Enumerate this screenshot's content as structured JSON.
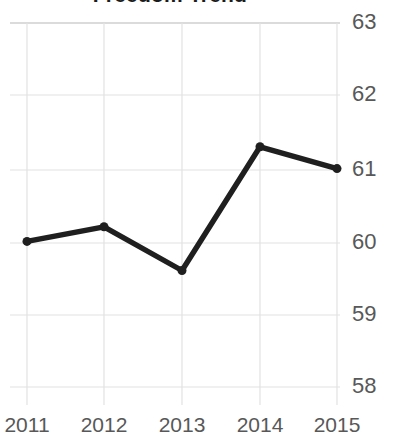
{
  "chart_data": {
    "type": "line",
    "title": "Freedom Trend",
    "xlabel": "",
    "ylabel": "",
    "categories": [
      "2011",
      "2012",
      "2013",
      "2014",
      "2015"
    ],
    "x": [
      2011,
      2012,
      2013,
      2014,
      2015
    ],
    "values": [
      60.0,
      60.2,
      59.6,
      61.3,
      61.0
    ],
    "series": [
      {
        "name": "Freedom Trend",
        "values": [
          60.0,
          60.2,
          59.6,
          61.3,
          61.0
        ]
      }
    ],
    "ylim": [
      58,
      63
    ],
    "yticks": [
      58,
      59,
      60,
      61,
      62,
      63
    ],
    "ytick_labels": [
      "58",
      "59",
      "60",
      "61",
      "62",
      "63"
    ],
    "xticks": [
      2011,
      2012,
      2013,
      2014,
      2015
    ],
    "xtick_labels": [
      "2011",
      "2012",
      "2013",
      "2014",
      "2015"
    ],
    "grid": true,
    "grid_axis": "both",
    "legend": false,
    "legend_position": "none",
    "y_axis_side": "right",
    "markers": true,
    "line_color": "#1f1f1f",
    "marker_color": "#1f1f1f",
    "grid_color": "#d9d9d9",
    "background_color": "#ffffff",
    "tick_label_color": "#585858",
    "title_color": "#1b1b1b",
    "line_width": 5,
    "marker_size": 9,
    "annotations": []
  },
  "axes": {
    "y_labels": [
      {
        "text": "63",
        "value": 63
      },
      {
        "text": "62",
        "value": 62
      },
      {
        "text": "61",
        "value": 61
      },
      {
        "text": "60",
        "value": 60
      },
      {
        "text": "59",
        "value": 59
      },
      {
        "text": "58",
        "value": 58
      }
    ],
    "x_labels": [
      {
        "text": "2011",
        "value": 2011
      },
      {
        "text": "2012",
        "value": 2012
      },
      {
        "text": "2013",
        "value": 2013
      },
      {
        "text": "2014",
        "value": 2014
      },
      {
        "text": "2015",
        "value": 2015
      }
    ]
  }
}
